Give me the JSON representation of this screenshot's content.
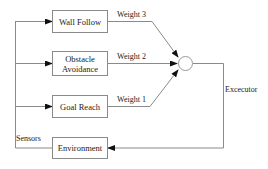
{
  "diagram": {
    "behaviors": [
      {
        "id": "wall-follow",
        "label": "Wall Follow",
        "weight": "Weight 3"
      },
      {
        "id": "obstacle-avoidance",
        "label": "Obstacle Avoidance",
        "line1": "Obstacle",
        "line2": "Avoidance",
        "weight": "Weight 2"
      },
      {
        "id": "goal-reach",
        "label": "Goal Reach",
        "weight": "Weight 1"
      }
    ],
    "environment": {
      "label": "Environment"
    },
    "sensors_label": "Sensors",
    "executor_label": "Excecutor",
    "summation_node": "weighted-sum-node",
    "colors": {
      "line": "#8a8a8a",
      "arrow": "#111111",
      "text": "#222222"
    }
  }
}
